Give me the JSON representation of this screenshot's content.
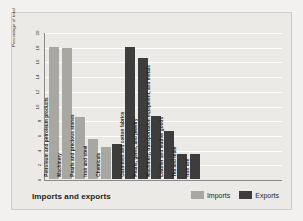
{
  "chart_data": {
    "type": "bar",
    "title": "Imports and exports",
    "xlabel": "",
    "ylabel": "Percentage of total",
    "ylim": [
      0,
      20
    ],
    "yticks": [
      0,
      2,
      4,
      6,
      8,
      10,
      12,
      14,
      16,
      18,
      20
    ],
    "grid": true,
    "legend_position": "bottom-right",
    "legend": [
      "Imports",
      "Exports"
    ],
    "categories": [
      "Petroleum and petroleum products",
      "Machinery",
      "Pearls and precious stones",
      "Iron and steel",
      "Chemicals",
      "Garments and cotton fabrics",
      "Pearls, gems, and jewelry",
      "Machinery, transportation equipment, and metals",
      "Leather and leather goods",
      "Tea and mate",
      "Iron ore"
    ],
    "series": [
      {
        "name": "Imports",
        "color": "#a9a7a2",
        "values": [
          18.0,
          17.8,
          8.5,
          5.5,
          4.4,
          null,
          null,
          null,
          null,
          null,
          null
        ]
      },
      {
        "name": "Exports",
        "color": "#3d3d3d",
        "values": [
          null,
          null,
          null,
          null,
          4.8,
          18.0,
          16.4,
          8.6,
          6.5,
          3.4,
          3.4
        ]
      }
    ]
  },
  "footer": {
    "title": "Imports and exports",
    "legend": [
      {
        "label": "Imports",
        "swatch": "imports"
      },
      {
        "label": "Exports",
        "swatch": "exports"
      }
    ]
  }
}
